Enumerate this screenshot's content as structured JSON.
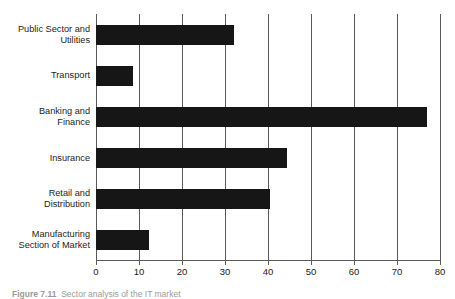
{
  "chart_data": {
    "type": "bar",
    "orientation": "horizontal",
    "title": "",
    "xlabel": "",
    "ylabel": "",
    "xlim": [
      0,
      80
    ],
    "xticks": [
      0,
      10,
      20,
      30,
      40,
      50,
      60,
      70,
      80
    ],
    "grid": true,
    "legend": null,
    "bar_color": "#161616",
    "grid_color": "#5a5a5a",
    "categories": [
      "Public Sector and Utilities",
      "Transport",
      "Banking and Finance",
      "Insurance",
      "Retail and Distribution",
      "Manufacturing Section of Market"
    ],
    "category_lines": [
      [
        "Public Sector and",
        "Utilities"
      ],
      [
        "Transport"
      ],
      [
        "Banking and",
        "Finance"
      ],
      [
        "Insurance"
      ],
      [
        "Retail and",
        "Distribution"
      ],
      [
        "Manufacturing",
        "Section of Market"
      ]
    ],
    "values": [
      32,
      8.5,
      77,
      44.5,
      40.5,
      12.3
    ]
  },
  "caption": {
    "label": "Figure 7.11",
    "text": "Figure 7.11  Sector analysis of the IT market"
  }
}
